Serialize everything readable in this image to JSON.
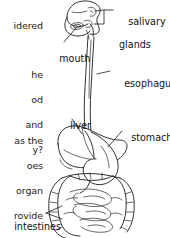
{
  "page": {
    "background_color": "#ffffff",
    "ink_color": "#1a1a1a",
    "width": 170,
    "height": 238
  },
  "body_text": {
    "paragraph_1": "idered",
    "paragraph_2_line_1": "he",
    "paragraph_2_line_2": "od",
    "paragraph_2_line_3": "and",
    "paragraph_2_line_4": "y?",
    "paragraph_3_line_1": "as the",
    "paragraph_3_line_2": "oes",
    "paragraph_3_line_3": "organ",
    "paragraph_3_line_4": "rovide"
  },
  "figure": {
    "type": "anatomical-diagram",
    "labels": {
      "salivary_glands_line_1": "salivary",
      "salivary_glands_line_2": "glands",
      "mouth": "mouth",
      "esophagus": "esophagus",
      "liver": "liver",
      "stomach": "stomach",
      "intestines": "intestines"
    },
    "organ_icons": {
      "head": "head-icon",
      "salivary_glands": "salivary-glands-icon",
      "esophagus": "esophagus-icon",
      "liver": "liver-icon",
      "stomach": "stomach-icon",
      "intestines": "intestines-icon"
    }
  }
}
